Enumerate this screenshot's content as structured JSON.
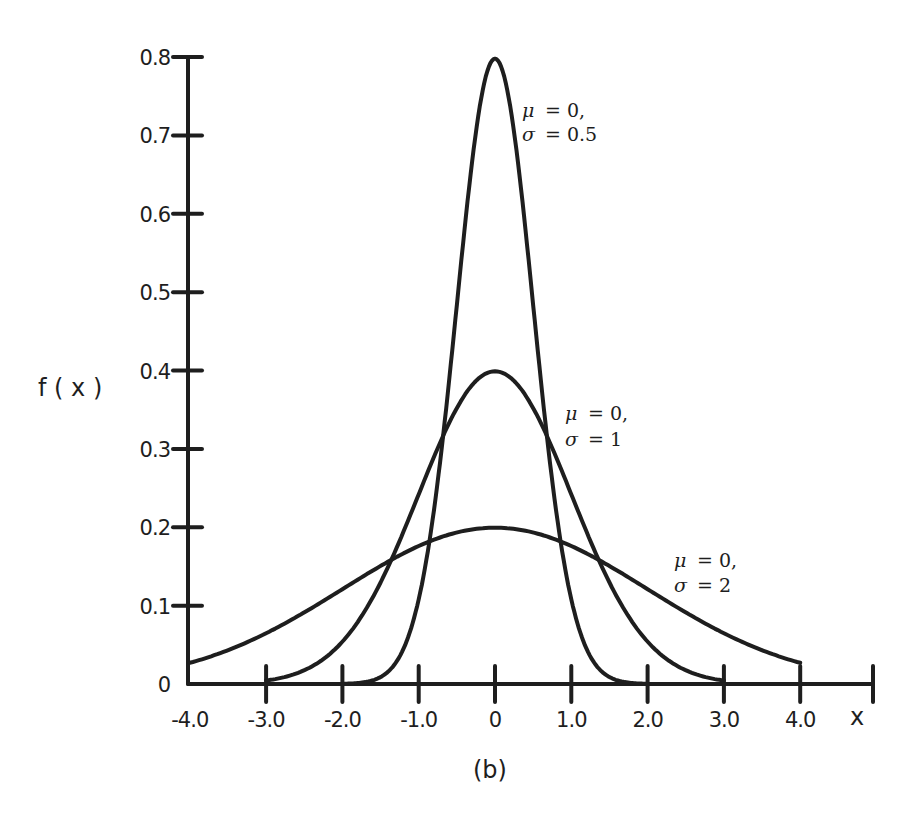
{
  "chart_data": {
    "type": "line",
    "title": "",
    "caption": "(b)",
    "xlabel": "x",
    "ylabel": "f (x)",
    "xlim": [
      -4.0,
      5.0
    ],
    "ylim": [
      0,
      0.8
    ],
    "grid": false,
    "legend_position": "inline annotations",
    "x_ticks": [
      -4.0,
      -3.0,
      -2.0,
      -1.0,
      0,
      1.0,
      2.0,
      3.0,
      4.0
    ],
    "x_tick_labels": [
      "-4.0",
      "-3.0",
      "-2.0",
      "-1.0",
      "0",
      "1.0",
      "2.0",
      "3.0",
      "4.0"
    ],
    "y_ticks": [
      0,
      0.1,
      0.2,
      0.3,
      0.4,
      0.5,
      0.6,
      0.7,
      0.8
    ],
    "y_tick_labels": [
      "0",
      "0.1",
      "0.2",
      "0.3",
      "0.4",
      "0.5",
      "0.6",
      "0.7",
      "0.8"
    ],
    "series": [
      {
        "name": "μ = 0, σ = 0.5",
        "mu": 0,
        "sigma": 0.5,
        "x_range": [
          -2.0,
          2.0
        ],
        "x": [
          -2.0,
          -1.5,
          -1.0,
          -0.5,
          0,
          0.5,
          1.0,
          1.5,
          2.0
        ],
        "values": [
          0.0003,
          0.0089,
          0.108,
          0.484,
          0.798,
          0.484,
          0.108,
          0.0089,
          0.0003
        ],
        "annotation": {
          "line1": "μ = 0,",
          "line2": "σ = 0.5"
        }
      },
      {
        "name": "μ = 0, σ = 1",
        "mu": 0,
        "sigma": 1,
        "x_range": [
          -3.0,
          3.0
        ],
        "x": [
          -3.0,
          -2.0,
          -1.0,
          0,
          1.0,
          2.0,
          3.0
        ],
        "values": [
          0.0044,
          0.054,
          0.242,
          0.399,
          0.242,
          0.054,
          0.0044
        ],
        "annotation": {
          "line1": "μ = 0,",
          "line2": "σ = 1"
        }
      },
      {
        "name": "μ = 0, σ = 2",
        "mu": 0,
        "sigma": 2,
        "x_range": [
          -4.0,
          4.0
        ],
        "x": [
          -4.0,
          -3.0,
          -2.0,
          -1.0,
          0,
          1.0,
          2.0,
          3.0,
          4.0
        ],
        "values": [
          0.027,
          0.065,
          0.121,
          0.176,
          0.199,
          0.176,
          0.121,
          0.065,
          0.027
        ],
        "annotation": {
          "line1": "μ = 0,",
          "line2": "σ = 2"
        }
      }
    ]
  },
  "labels": {
    "ylabel": "f ( x )",
    "xlabel": "x",
    "caption": "(b)",
    "annot_sigma05_l1_sym": "μ",
    "annot_sigma05_l1_val": "= 0,",
    "annot_sigma05_l2_sym": "σ",
    "annot_sigma05_l2_val": "= 0.5",
    "annot_sigma1_l1_sym": "μ",
    "annot_sigma1_l1_val": "= 0,",
    "annot_sigma1_l2_sym": "σ",
    "annot_sigma1_l2_val": "= 1",
    "annot_sigma2_l1_sym": "μ",
    "annot_sigma2_l1_val": "= 0,",
    "annot_sigma2_l2_sym": "σ",
    "annot_sigma2_l2_val": "= 2"
  },
  "style": {
    "ink": "#1e1e1e",
    "background": "#ffffff"
  }
}
